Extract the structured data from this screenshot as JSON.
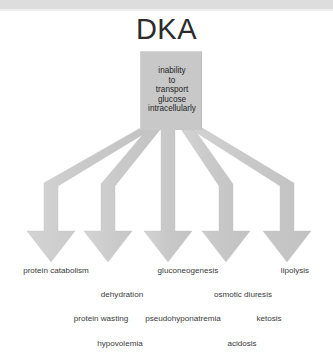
{
  "window": {
    "top_bar_color": "#dddddd"
  },
  "diagram": {
    "title": "DKA",
    "colors": {
      "shape_fill": "#c8c8c8",
      "shape_fill_light": "#d2d2d2",
      "text": "#3a3a3a",
      "title_text": "#2b2b2b"
    },
    "root_box": {
      "label": "inability\nto\ntransport\nglucose\nintracellularly",
      "lines": [
        "inability",
        "to",
        "transport",
        "glucose",
        "intracellularly"
      ]
    },
    "arrows": [
      {
        "name": "arrow-protein-catabolism",
        "center_x": 51
      },
      {
        "name": "arrow-dehydration",
        "center_x": 108
      },
      {
        "name": "arrow-gluconeogenesis",
        "center_x": 168
      },
      {
        "name": "arrow-osmotic-diuresis",
        "center_x": 226
      },
      {
        "name": "arrow-lipolysis",
        "center_x": 287
      }
    ],
    "outcome_rows": [
      {
        "row": 1,
        "items": [
          {
            "label": "protein catabolism",
            "x": 56,
            "y": 266
          },
          {
            "label": "gluconeogenesis",
            "x": 188,
            "y": 266
          },
          {
            "label": "lipolysis",
            "x": 295,
            "y": 266
          }
        ]
      },
      {
        "row": 2,
        "items": [
          {
            "label": "dehydration",
            "x": 122,
            "y": 290
          },
          {
            "label": "osmotic diuresis",
            "x": 243,
            "y": 290
          }
        ]
      },
      {
        "row": 3,
        "items": [
          {
            "label": "protein wasting",
            "x": 101,
            "y": 314
          },
          {
            "label": "pseudohyponatremia",
            "x": 183,
            "y": 314
          },
          {
            "label": "ketosis",
            "x": 269,
            "y": 314
          }
        ]
      },
      {
        "row": 4,
        "items": [
          {
            "label": "hypovolemia",
            "x": 120,
            "y": 339
          },
          {
            "label": "acidosis",
            "x": 242,
            "y": 339
          }
        ]
      }
    ]
  }
}
